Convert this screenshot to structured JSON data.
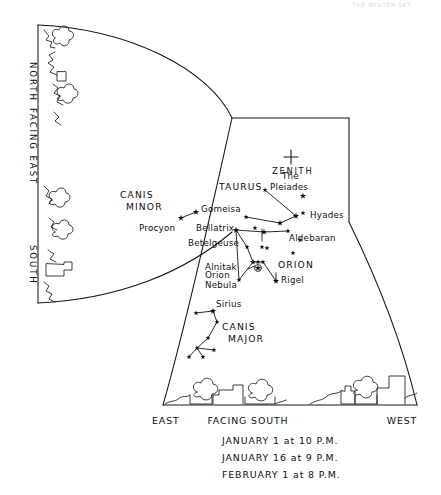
{
  "page_header": "THE WINTER SKY",
  "chart_data": {
    "type": "scatter",
    "grid": false,
    "legend": null,
    "edge_labels": {
      "left_panel": [
        "NORTH",
        "FACING EAST",
        "SOUTH"
      ],
      "bottom_left": "EAST",
      "bottom_center": "FACING SOUTH",
      "bottom_right": "WEST"
    },
    "caption_lines": [
      "JANUARY 1 at 10 P.M.",
      "JANUARY 16 at 9 P.M.",
      "FEBRUARY 1 at 8 P.M."
    ],
    "zenith": {
      "label": "ZENITH",
      "x": 291,
      "y": 157,
      "marker": "plus"
    },
    "constellations": [
      {
        "name": "CANIS MINOR",
        "label_x": 120,
        "label_y": 198,
        "stars": [
          [
            181,
            218
          ],
          [
            196,
            212
          ]
        ],
        "lines": [
          [
            [
              181,
              218
            ],
            [
              196,
              212
            ]
          ]
        ]
      },
      {
        "name": "TAURUS",
        "label_x": 219,
        "label_y": 190,
        "stars": [
          [
            265,
            190
          ],
          [
            246,
            217
          ],
          [
            255,
            228
          ],
          [
            280,
            223
          ],
          [
            296,
            216
          ],
          [
            303,
            213
          ]
        ],
        "lines": [
          [
            [
              265,
              190
            ],
            [
              296,
              216
            ]
          ],
          [
            [
              246,
              217
            ],
            [
              280,
              223
            ]
          ],
          [
            [
              280,
              223
            ],
            [
              296,
              216
            ]
          ]
        ]
      },
      {
        "name": "ORION",
        "label_x": 278,
        "label_y": 268,
        "stars": [
          [
            236,
            230
          ],
          [
            264,
            232
          ],
          [
            288,
            231
          ],
          [
            300,
            240
          ],
          [
            247,
            247
          ],
          [
            262,
            247
          ],
          [
            267,
            248
          ],
          [
            253,
            262
          ],
          [
            258,
            262
          ],
          [
            263,
            262
          ],
          [
            239,
            280
          ],
          [
            276,
            281
          ],
          [
            293,
            253
          ]
        ],
        "lines": [
          [
            [
              236,
              230
            ],
            [
              264,
              232
            ]
          ],
          [
            [
              264,
              232
            ],
            [
              288,
              231
            ]
          ],
          [
            [
              236,
              230
            ],
            [
              247,
              247
            ]
          ],
          [
            [
              247,
              247
            ],
            [
              253,
              262
            ]
          ],
          [
            [
              253,
              262
            ],
            [
              263,
              262
            ]
          ],
          [
            [
              263,
              262
            ],
            [
              276,
              281
            ]
          ],
          [
            [
              236,
              230
            ],
            [
              239,
              280
            ]
          ],
          [
            [
              239,
              280
            ],
            [
              253,
              262
            ]
          ]
        ]
      },
      {
        "name": "CANIS MAJOR",
        "label_x": 222,
        "label_y": 330,
        "stars": [
          [
            196,
            313
          ],
          [
            213,
            311
          ],
          [
            217,
            322
          ],
          [
            208,
            338
          ],
          [
            197,
            348
          ],
          [
            214,
            350
          ],
          [
            189,
            357
          ],
          [
            203,
            357
          ]
        ],
        "lines": [
          [
            [
              196,
              313
            ],
            [
              213,
              311
            ]
          ],
          [
            [
              213,
              311
            ],
            [
              217,
              322
            ]
          ],
          [
            [
              217,
              322
            ],
            [
              208,
              338
            ]
          ],
          [
            [
              208,
              338
            ],
            [
              197,
              348
            ]
          ],
          [
            [
              197,
              348
            ],
            [
              214,
              350
            ]
          ],
          [
            [
              197,
              348
            ],
            [
              189,
              357
            ]
          ],
          [
            [
              197,
              348
            ],
            [
              203,
              357
            ]
          ]
        ]
      }
    ],
    "stars": [
      {
        "name": "Gomeisa",
        "x": 196,
        "y": 212,
        "label_x": 201,
        "label_y": 212
      },
      {
        "name": "Procyon",
        "x": 181,
        "y": 218,
        "label_x": 139,
        "label_y": 231
      },
      {
        "name": "Bellatrix",
        "x": 264,
        "y": 232,
        "label_x": 196,
        "label_y": 231
      },
      {
        "name": "Betelgeuse",
        "x": 236,
        "y": 230,
        "label_x": 188,
        "label_y": 246
      },
      {
        "name": "Alnitak",
        "x": 253,
        "y": 262,
        "label_x": 205,
        "label_y": 270
      },
      {
        "name": "Orion Nebula",
        "x": 258,
        "y": 268,
        "label_x": 205,
        "label_y": 278
      },
      {
        "name": "Rigel",
        "x": 276,
        "y": 281,
        "label_x": 281,
        "label_y": 283
      },
      {
        "name": "Sirius",
        "x": 213,
        "y": 311,
        "label_x": 216,
        "label_y": 307
      },
      {
        "name": "Aldebaran",
        "x": 280,
        "y": 223,
        "label_x": 289,
        "label_y": 241
      },
      {
        "name": "Hyades",
        "x": 296,
        "y": 216,
        "label_x": 310,
        "label_y": 218
      },
      {
        "name": "The Pleiades",
        "x": 303,
        "y": 196,
        "label_x": 276,
        "label_y": 179
      }
    ]
  }
}
